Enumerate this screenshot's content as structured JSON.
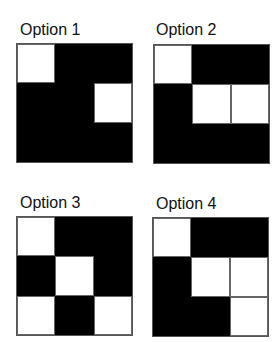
{
  "options": [
    {
      "label": "Option 1",
      "cells": [
        "w",
        "b",
        "b",
        "b",
        "b",
        "w",
        "b",
        "b",
        "b"
      ]
    },
    {
      "label": "Option 2",
      "cells": [
        "w",
        "b",
        "b",
        "b",
        "w",
        "w",
        "b",
        "b",
        "b"
      ]
    },
    {
      "label": "Option 3",
      "cells": [
        "w",
        "b",
        "b",
        "b",
        "w",
        "b",
        "w",
        "b",
        "w"
      ]
    },
    {
      "label": "Option 4",
      "cells": [
        "w",
        "b",
        "b",
        "b",
        "w",
        "w",
        "b",
        "b",
        "w"
      ]
    }
  ],
  "colors": {
    "filled": "#000000",
    "empty": "#ffffff",
    "border": "#555555"
  }
}
